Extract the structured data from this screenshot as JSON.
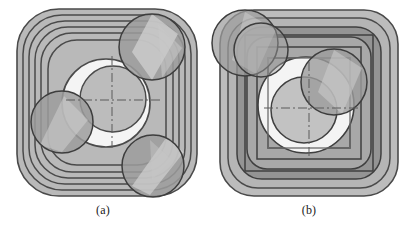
{
  "figure": {
    "background_color": "#ffffff",
    "panels": [
      {
        "id": "panel-a",
        "caption": "(a)",
        "description": "Offset contour pattern with smooth concentric rounded-square loops",
        "outline_style": "rounded-square",
        "contour_count": 6,
        "fill_color": "#b9b9b9",
        "line_color": "#4a4a4a",
        "core_color": "#f2f2f2",
        "circle_color": "#9a9a9a",
        "highlight_color": "#cfcfcf",
        "circles": [
          {
            "name": "probe-circle-top-right",
            "cx": 152,
            "cy": 47,
            "r": 33
          },
          {
            "name": "probe-circle-left",
            "cx": 62,
            "cy": 122,
            "r": 31
          },
          {
            "name": "probe-circle-bottom-right",
            "cx": 153,
            "cy": 166,
            "r": 31
          },
          {
            "name": "core-circle-center",
            "cx": 106,
            "cy": 103,
            "r": 33
          }
        ],
        "center_mark": {
          "x": 112,
          "y": 100,
          "type": "dash-dot-crosshair"
        }
      },
      {
        "id": "panel-b",
        "caption": "(b)",
        "description": "Offset contour pattern with nested square and rounded-square loops",
        "outline_style": "nested-square",
        "contour_count": 7,
        "fill_color": "#b9b9b9",
        "band_color": "#909090",
        "line_color": "#4a4a4a",
        "core_color": "#f4f4f4",
        "circle_color": "#9a9a9a",
        "highlight_color": "#cfcfcf",
        "circles": [
          {
            "name": "probe-circle-top-left-outer",
            "cx": 39,
            "cy": 43,
            "r": 33
          },
          {
            "name": "probe-circle-top-left-inner",
            "cx": 55,
            "cy": 50,
            "r": 27
          },
          {
            "name": "probe-circle-right",
            "cx": 128,
            "cy": 82,
            "r": 33
          },
          {
            "name": "core-circle-center",
            "cx": 98,
            "cy": 110,
            "r": 33
          },
          {
            "name": "core-circle-outer",
            "cx": 100,
            "cy": 105,
            "r": 48
          }
        ],
        "center_mark": {
          "x": 103,
          "y": 108,
          "type": "dash-dot-crosshair"
        }
      }
    ]
  }
}
